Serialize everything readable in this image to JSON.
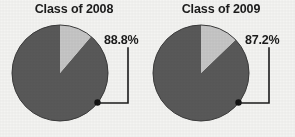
{
  "figure": {
    "background_color": "#f4f4f2",
    "text_color": "#1b1b1b"
  },
  "panels": [
    {
      "title": "Class of 2008",
      "callout_label": "88.8%"
    },
    {
      "title": "Class of 2009",
      "callout_label": "87.2%"
    }
  ],
  "chart_data": [
    {
      "type": "pie",
      "title": "Class of 2008",
      "labels": [
        "88.8%",
        ""
      ],
      "values": [
        88.8,
        11.2
      ],
      "colors": [
        "#595959",
        "#c6c6c6"
      ],
      "annotations": [
        "88.8%"
      ],
      "start_angle_deg": 90,
      "direction": "counterclockwise",
      "legend": "none",
      "grid": false
    },
    {
      "type": "pie",
      "title": "Class of 2009",
      "labels": [
        "87.2%",
        ""
      ],
      "values": [
        87.2,
        12.8
      ],
      "colors": [
        "#595959",
        "#c6c6c6"
      ],
      "annotations": [
        "87.2%"
      ],
      "start_angle_deg": 90,
      "direction": "counterclockwise",
      "legend": "none",
      "grid": false
    }
  ]
}
